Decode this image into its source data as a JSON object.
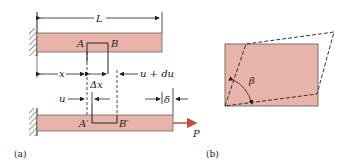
{
  "colors": {
    "bar_fill": "#e8b4aa",
    "bar_stroke": "#555555",
    "load_arrow": "#c0503a",
    "line": "#222222"
  },
  "panel_a": {
    "caption": "(a)",
    "labels": {
      "length": "L",
      "point_a": "A",
      "point_b": "B",
      "position_x": "x",
      "delta_x": "Δx",
      "u_plus_du": "u + du",
      "u": "u",
      "delta": "δ",
      "point_a_prime": "A′",
      "point_b_prime": "B′",
      "load": "P"
    }
  },
  "panel_b": {
    "caption": "(b)",
    "labels": {
      "angle": "β"
    }
  }
}
